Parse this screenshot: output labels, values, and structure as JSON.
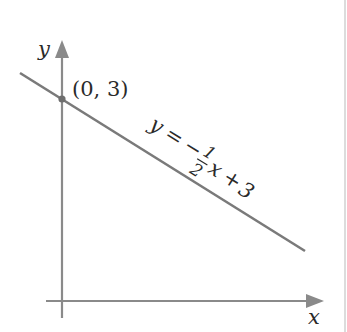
{
  "diagram": {
    "type": "graph-of-line",
    "axes": {
      "x_label": "x",
      "y_label": "y"
    },
    "line": {
      "equation_parts": {
        "lhs": "y",
        "eq": "=",
        "minus": "−",
        "frac_num": "1",
        "frac_den": "2",
        "x": "x",
        "plus": "+",
        "const": "3"
      },
      "slope": -0.5,
      "intercept": 3
    },
    "point": {
      "label": "(0, 3)",
      "x": 0,
      "y": 3
    },
    "colors": {
      "axis": "#8a8a8a",
      "line": "#7a7a7a",
      "text": "#2a2a2a",
      "border": "#cfcfcf"
    }
  }
}
